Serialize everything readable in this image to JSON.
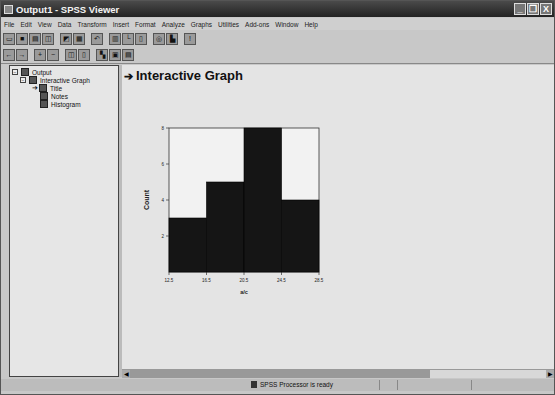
{
  "window": {
    "title": "Output1 - SPSS Viewer",
    "controls": [
      "_",
      "❐",
      "X"
    ]
  },
  "menubar": [
    "File",
    "Edit",
    "View",
    "Data",
    "Transform",
    "Insert",
    "Format",
    "Analyze",
    "Graphs",
    "Utilities",
    "Add-ons",
    "Window",
    "Help"
  ],
  "toolbar1": [
    "open",
    "save",
    "print",
    "print-preview",
    "export",
    "recall-dialog",
    "undo",
    "goto-data",
    "goto-case",
    "variables",
    "insert-results",
    "designate-window",
    "help"
  ],
  "toolbar2": [
    "promote",
    "demote",
    "expand",
    "collapse",
    "show",
    "hide",
    "insert-heading",
    "insert-title",
    "insert-text"
  ],
  "outline": {
    "items": [
      {
        "label": "Output",
        "level": 0
      },
      {
        "label": "Interactive Graph",
        "level": 1
      },
      {
        "label": "Title",
        "level": 2
      },
      {
        "label": "Notes",
        "level": 2
      },
      {
        "label": "Histogram",
        "level": 2
      }
    ]
  },
  "content": {
    "heading": "Interactive Graph"
  },
  "status": {
    "message": "SPSS Processor  is ready"
  },
  "chart_data": {
    "type": "bar",
    "subtype": "histogram",
    "title": "",
    "xlabel": "a/c",
    "ylabel": "Count",
    "bin_edges": [
      12.5,
      16.5,
      20.5,
      24.5,
      28.5
    ],
    "categories": [
      "12.5-16.5",
      "16.5-20.5",
      "20.5-24.5",
      "24.5-28.5"
    ],
    "values": [
      3,
      5,
      8,
      4
    ],
    "x_ticks": [
      "12.5",
      "16.5",
      "20.5",
      "24.5",
      "28.5"
    ],
    "y_ticks": [
      "2",
      "4",
      "6",
      "8"
    ],
    "ylim": [
      0,
      8
    ],
    "grid": false,
    "bar_color": "#151515"
  }
}
